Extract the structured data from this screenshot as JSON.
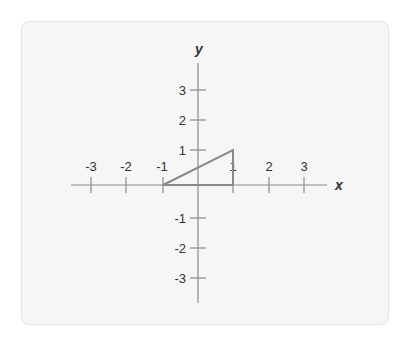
{
  "diagram": {
    "type": "coordinate-plane",
    "axis_labels": {
      "x": "x",
      "y": "y"
    },
    "x_ticks": [
      {
        "value": -3,
        "label": "-3",
        "px": 91
      },
      {
        "value": -2,
        "label": "-2",
        "px": 126
      },
      {
        "value": -1,
        "label": "-1",
        "px": 163
      },
      {
        "value": 1,
        "label": "1",
        "px": 233
      },
      {
        "value": 2,
        "label": "2",
        "px": 269
      },
      {
        "value": 3,
        "label": "3",
        "px": 304
      }
    ],
    "y_ticks": [
      {
        "value": 3,
        "label": "3",
        "py": 90
      },
      {
        "value": 2,
        "label": "2",
        "py": 120
      },
      {
        "value": 1,
        "label": "1",
        "py": 150
      },
      {
        "value": -1,
        "label": "-1",
        "py": 218
      },
      {
        "value": -2,
        "label": "-2",
        "py": 248
      },
      {
        "value": -3,
        "label": "-3",
        "py": 278
      }
    ],
    "triangle": {
      "vertices": [
        [
          -1,
          0
        ],
        [
          1,
          0
        ],
        [
          1,
          1
        ]
      ],
      "stroke": "#8a8a8a"
    },
    "origin_px": [
      198,
      185
    ]
  }
}
